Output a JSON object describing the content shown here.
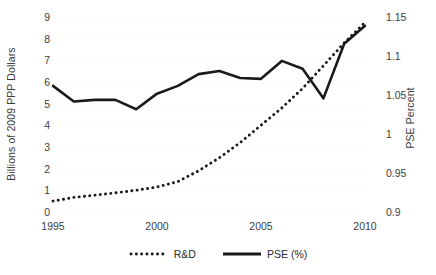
{
  "chart_data": {
    "type": "line",
    "title": "",
    "subtitle": "",
    "xlabel": "",
    "ylabel": "Billions of 2009 PPP Dollars",
    "y2label": "PSE Percent",
    "grid": true,
    "legend_position": "bottom",
    "x": [
      1995,
      1996,
      1997,
      1998,
      1999,
      2000,
      2001,
      2002,
      2003,
      2004,
      2005,
      2006,
      2007,
      2008,
      2009,
      2010
    ],
    "xlim": [
      1995,
      2010
    ],
    "xticks": [
      1995,
      2000,
      2005,
      2010
    ],
    "xticklabels": [
      "1995",
      "2000",
      "2005",
      "2010"
    ],
    "ylim": [
      0,
      9
    ],
    "yticks": [
      0,
      1,
      2,
      3,
      4,
      5,
      6,
      7,
      8,
      9
    ],
    "yticklabels": [
      "0",
      "1",
      "2",
      "3",
      "4",
      "5",
      "6",
      "7",
      "8",
      "9"
    ],
    "y2lim": [
      0.9,
      1.15
    ],
    "y2ticks": [
      0.9,
      0.95,
      1.0,
      1.05,
      1.1,
      1.15
    ],
    "y2ticklabels": [
      "0.9",
      "0.95",
      "1",
      "1.05",
      "1.1",
      "1.15"
    ],
    "series": [
      {
        "name": "R&D",
        "axis": "left",
        "style": "dotted",
        "color": "#1a1a1a",
        "values": [
          0.55,
          0.72,
          0.82,
          0.93,
          1.05,
          1.2,
          1.45,
          1.95,
          2.55,
          3.25,
          4.05,
          4.85,
          5.75,
          6.8,
          7.85,
          8.8
        ]
      },
      {
        "name": "PSE (%)",
        "axis": "right",
        "style": "solid",
        "color": "#1a1a1a",
        "values": [
          1.063,
          1.043,
          1.045,
          1.045,
          1.033,
          1.053,
          1.063,
          1.078,
          1.082,
          1.073,
          1.072,
          1.095,
          1.085,
          1.047,
          1.117,
          1.14
        ]
      }
    ],
    "legend": [
      {
        "label": "R&D",
        "style": "dotted"
      },
      {
        "label": "PSE (%)",
        "style": "solid"
      }
    ]
  }
}
